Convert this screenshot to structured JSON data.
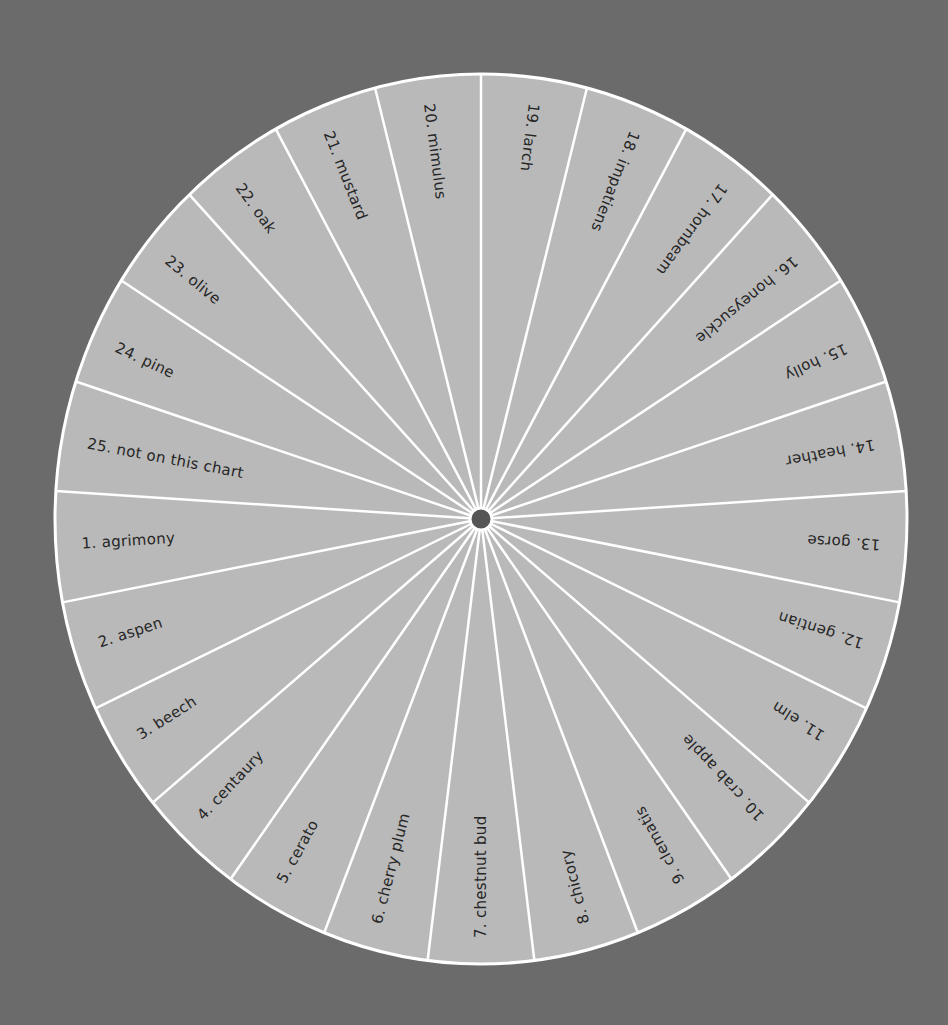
{
  "colors": {
    "background": "#6b6b6b",
    "disc": "#b9b9b9",
    "divider": "#ffffff",
    "text": "#262626",
    "hub": "#555555"
  },
  "wheel": {
    "center": [
      481,
      519
    ],
    "radius_x": 426,
    "radius_y": 445,
    "hub_radius": 11,
    "segment_count": 25,
    "label_start_radius": 402,
    "order_clockwise_from_top": [
      19,
      18,
      17,
      16,
      15,
      14,
      13,
      12,
      11,
      10,
      9,
      8,
      7,
      6,
      5,
      4,
      3,
      2,
      1,
      25,
      24,
      23,
      22,
      21,
      20
    ]
  },
  "segments": [
    {
      "num": 1,
      "label": "1.  agrimony"
    },
    {
      "num": 2,
      "label": "2.  aspen"
    },
    {
      "num": 3,
      "label": "3.  beech"
    },
    {
      "num": 4,
      "label": "4.  centaury"
    },
    {
      "num": 5,
      "label": "5.  cerato"
    },
    {
      "num": 6,
      "label": "6.  cherry plum"
    },
    {
      "num": 7,
      "label": "7.  chestnut bud"
    },
    {
      "num": 8,
      "label": "8.  chicory"
    },
    {
      "num": 9,
      "label": "9.  clematis"
    },
    {
      "num": 10,
      "label": "10.  crab apple"
    },
    {
      "num": 11,
      "label": "11.  elm"
    },
    {
      "num": 12,
      "label": "12.  gentian"
    },
    {
      "num": 13,
      "label": "13.  gorse"
    },
    {
      "num": 14,
      "label": "14.  heather"
    },
    {
      "num": 15,
      "label": "15.  holly"
    },
    {
      "num": 16,
      "label": "16.  honeysuckle"
    },
    {
      "num": 17,
      "label": "17.  hornbeam"
    },
    {
      "num": 18,
      "label": "18.  impatiens"
    },
    {
      "num": 19,
      "label": "19.  larch"
    },
    {
      "num": 20,
      "label": "20.  mimulus"
    },
    {
      "num": 21,
      "label": "21.  mustard"
    },
    {
      "num": 22,
      "label": "22.  oak"
    },
    {
      "num": 23,
      "label": "23.  olive"
    },
    {
      "num": 24,
      "label": "24.  pine"
    },
    {
      "num": 25,
      "label": "25.  not on this chart"
    }
  ]
}
